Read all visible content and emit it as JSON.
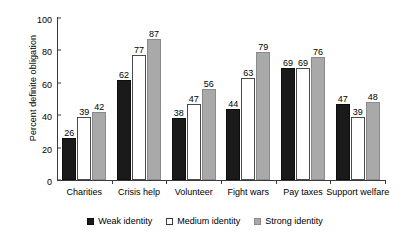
{
  "chart_data": {
    "type": "bar",
    "title": "",
    "xlabel": "",
    "ylabel": "Percent definite obligation",
    "ylim": [
      0,
      100
    ],
    "yticks": [
      0,
      20,
      40,
      60,
      80,
      100
    ],
    "ytick_labels": [
      "0",
      "20",
      "40",
      "60",
      "80",
      "100"
    ],
    "grid": false,
    "legend_position": "bottom-center",
    "categories": [
      "Charities",
      "Crisis help",
      "Volunteer",
      "Fight wars",
      "Pay taxes",
      "Support welfare"
    ],
    "series": [
      {
        "name": "Weak identity",
        "color": "#1a1a1a",
        "values": [
          26,
          62,
          38,
          44,
          69,
          47
        ]
      },
      {
        "name": "Medium identity",
        "color": "#ffffff",
        "values": [
          39,
          77,
          47,
          63,
          69,
          39
        ]
      },
      {
        "name": "Strong identity",
        "color": "#a9a9a9",
        "values": [
          42,
          87,
          56,
          79,
          76,
          48
        ]
      }
    ]
  }
}
